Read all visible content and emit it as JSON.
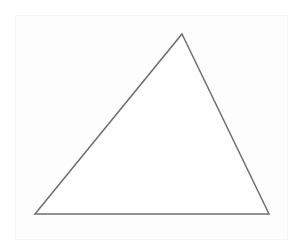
{
  "diagram": {
    "shape": "triangle",
    "vertices": {
      "apex": [
        182,
        34
      ],
      "bottom_left": [
        35,
        214
      ],
      "bottom_right": [
        269,
        214
      ]
    },
    "stroke_color": "#6e6e6e",
    "stroke_width": 1.5,
    "fill_color": "#ffffff",
    "background_color": "#ffffff",
    "panel_color": "#fdfdfd"
  }
}
